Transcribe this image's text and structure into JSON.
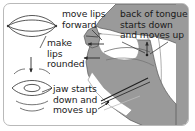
{
  "figure": {
    "border_color": "#b9b9b9",
    "background_color": "#ffffff",
    "head_fill_color": "#9a9a9a",
    "head_outline_color": "#4d4d4d",
    "text_color": "#1a1a1a",
    "lip_outline_color": "#3a3a3a"
  },
  "labels": {
    "move_lips": "move lips\nforward",
    "back_of_tongue": "back of tongue\nstarts down\nand moves up",
    "make_lips_rounded": "make\nlips\nrounded",
    "jaw": "jaw starts\ndown and\nmoves up"
  },
  "icons": {
    "lips_open": "open-lips-icon",
    "lips_rounded": "rounded-lips-icon",
    "arrow_down_between_lips": "arrow-down-icon",
    "arrow_to_lips_upper": "arrow-left-icon",
    "arrow_to_lips_lower": "arrow-left-icon",
    "arrow_tongue_up": "arrow-up-icon",
    "arrow_jaw": "arrow-pointer-icon"
  },
  "head_diagram": {
    "name": "sagittal-head-cross-section",
    "parts": [
      "lips",
      "hard-palate",
      "soft-palate",
      "tongue",
      "jaw",
      "throat"
    ]
  }
}
